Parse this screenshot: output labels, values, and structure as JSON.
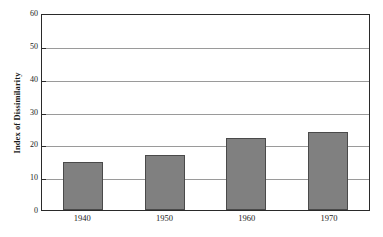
{
  "chart_data": {
    "type": "bar",
    "title": "",
    "xlabel": "",
    "ylabel": "Index of Dissimilarity",
    "categories": [
      "1940",
      "1950",
      "1960",
      "1970"
    ],
    "values": [
      14.6,
      16.8,
      22.0,
      23.8
    ],
    "ylim": [
      0,
      60
    ],
    "ytick_values": [
      60,
      50,
      40,
      30,
      20,
      10,
      0
    ],
    "ytick_labels": [
      "60",
      "50",
      "40",
      "30",
      "20",
      "10",
      "0"
    ],
    "grid": true,
    "legend": false,
    "legend_position": "none",
    "series": [
      {
        "name": "Index of Dissimilarity",
        "values": [
          14.6,
          16.8,
          22.0,
          23.8
        ]
      }
    ],
    "colors": {
      "bar_fill": "#808080",
      "bar_border": "#4a4a4a",
      "gridline": "#9a9a9a",
      "axis": "#2a2a2a",
      "text": "#1a1a1a",
      "background": "#ffffff"
    }
  }
}
